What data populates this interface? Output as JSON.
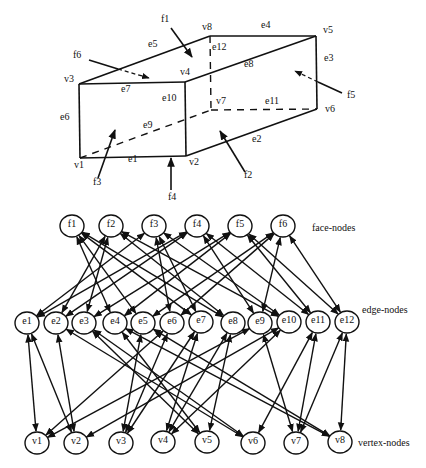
{
  "box": {
    "vertices": [
      {
        "id": "v1",
        "x": 80,
        "y": 158,
        "lx": 74,
        "ly": 168
      },
      {
        "id": "v2",
        "x": 186,
        "y": 156,
        "lx": 189,
        "ly": 165
      },
      {
        "id": "v3",
        "x": 79,
        "y": 84,
        "lx": 64,
        "ly": 82
      },
      {
        "id": "v4",
        "x": 185,
        "y": 82,
        "lx": 180,
        "ly": 75
      },
      {
        "id": "v5",
        "x": 316,
        "y": 36,
        "lx": 323,
        "ly": 33
      },
      {
        "id": "v6",
        "x": 317,
        "y": 109,
        "lx": 325,
        "ly": 112
      },
      {
        "id": "v7",
        "x": 211,
        "y": 110,
        "lx": 215,
        "ly": 104
      },
      {
        "id": "v8",
        "x": 210,
        "y": 36,
        "lx": 202,
        "ly": 30
      }
    ],
    "solid_lines": [
      [
        "v1",
        "v2"
      ],
      [
        "v2",
        "v6"
      ],
      [
        "v5",
        "v6"
      ],
      [
        "v8",
        "v5"
      ],
      [
        "v3",
        "v8"
      ],
      [
        "v1",
        "v3"
      ],
      [
        "v3",
        "v4"
      ],
      [
        "v4",
        "v5"
      ],
      [
        "v2",
        "v4"
      ]
    ],
    "dashed_lines": [
      [
        "v1",
        "v7"
      ],
      [
        "v7",
        "v6"
      ],
      [
        "v8",
        "v7"
      ]
    ],
    "edge_labels": [
      {
        "text": "e1",
        "x": 128,
        "y": 162
      },
      {
        "text": "e2",
        "x": 252,
        "y": 142
      },
      {
        "text": "e3",
        "x": 324,
        "y": 61
      },
      {
        "text": "e4",
        "x": 261,
        "y": 28
      },
      {
        "text": "e5",
        "x": 148,
        "y": 47
      },
      {
        "text": "e6",
        "x": 60,
        "y": 120
      },
      {
        "text": "e7",
        "x": 121,
        "y": 92
      },
      {
        "text": "e8",
        "x": 244,
        "y": 67
      },
      {
        "text": "e9",
        "x": 143,
        "y": 128
      },
      {
        "text": "e10",
        "x": 162,
        "y": 101
      },
      {
        "text": "e11",
        "x": 265,
        "y": 104
      },
      {
        "text": "e12",
        "x": 212,
        "y": 50
      },
      {
        "text": "v7",
        "x": 216,
        "y": 104
      }
    ],
    "face_arrows": [
      {
        "id": "f1",
        "lx": 161,
        "ly": 22,
        "x1": 171,
        "y1": 28,
        "x2": 192,
        "y2": 57,
        "dashed_from": null
      },
      {
        "id": "f2",
        "lx": 244,
        "ly": 178,
        "x1": 245,
        "y1": 172,
        "x2": 220,
        "y2": 131,
        "dashed_from": null
      },
      {
        "id": "f3",
        "lx": 93,
        "ly": 185,
        "x1": 98,
        "y1": 178,
        "x2": 115,
        "y2": 130,
        "dashed_from": null
      },
      {
        "id": "f4",
        "lx": 168,
        "ly": 200,
        "x1": 171,
        "y1": 190,
        "x2": 171,
        "y2": 158,
        "dashed_from": null
      },
      {
        "id": "f5",
        "lx": 347,
        "ly": 98,
        "x1": 342,
        "y1": 93,
        "x2": 295,
        "y2": 71,
        "dashed_from": [
          318,
          82
        ]
      },
      {
        "id": "f6",
        "lx": 73,
        "ly": 58,
        "x1": 89,
        "y1": 60,
        "x2": 149,
        "y2": 78,
        "dashed_from": [
          118,
          69
        ]
      }
    ]
  },
  "graph": {
    "row_labels": {
      "face": "face-nodes",
      "edge": "edge-nodes",
      "vertex": "vertex-nodes"
    },
    "face_nodes": [
      {
        "id": "f1",
        "x": 72,
        "y": 226
      },
      {
        "id": "f2",
        "x": 111,
        "y": 226
      },
      {
        "id": "f3",
        "x": 154,
        "y": 226
      },
      {
        "id": "f4",
        "x": 197,
        "y": 226
      },
      {
        "id": "f5",
        "x": 240,
        "y": 226
      },
      {
        "id": "f6",
        "x": 283,
        "y": 226
      }
    ],
    "edge_nodes": [
      {
        "id": "e1",
        "x": 27,
        "y": 323
      },
      {
        "id": "e2",
        "x": 56,
        "y": 323
      },
      {
        "id": "e3",
        "x": 84,
        "y": 323
      },
      {
        "id": "e4",
        "x": 115,
        "y": 323
      },
      {
        "id": "e5",
        "x": 143,
        "y": 323
      },
      {
        "id": "e6",
        "x": 172,
        "y": 323
      },
      {
        "id": "e7",
        "x": 201,
        "y": 322
      },
      {
        "id": "e8",
        "x": 233,
        "y": 323
      },
      {
        "id": "e9",
        "x": 260,
        "y": 323
      },
      {
        "id": "e10",
        "x": 289,
        "y": 322
      },
      {
        "id": "e11",
        "x": 318,
        "y": 322
      },
      {
        "id": "e12",
        "x": 347,
        "y": 322
      }
    ],
    "vertex_nodes": [
      {
        "id": "v1",
        "x": 37,
        "y": 443
      },
      {
        "id": "v2",
        "x": 76,
        "y": 443
      },
      {
        "id": "v3",
        "x": 121,
        "y": 443
      },
      {
        "id": "v4",
        "x": 163,
        "y": 442
      },
      {
        "id": "v5",
        "x": 207,
        "y": 442
      },
      {
        "id": "v6",
        "x": 253,
        "y": 443
      },
      {
        "id": "v7",
        "x": 296,
        "y": 443
      },
      {
        "id": "v8",
        "x": 340,
        "y": 442
      }
    ],
    "face_edge_links": [
      [
        "f1",
        "e4"
      ],
      [
        "f1",
        "e5"
      ],
      [
        "f1",
        "e7"
      ],
      [
        "f1",
        "e8"
      ],
      [
        "f2",
        "e2"
      ],
      [
        "f2",
        "e3"
      ],
      [
        "f2",
        "e8"
      ],
      [
        "f2",
        "e10"
      ],
      [
        "f3",
        "e1"
      ],
      [
        "f3",
        "e6"
      ],
      [
        "f3",
        "e7"
      ],
      [
        "f3",
        "e10"
      ],
      [
        "f4",
        "e1"
      ],
      [
        "f4",
        "e2"
      ],
      [
        "f4",
        "e9"
      ],
      [
        "f4",
        "e11"
      ],
      [
        "f5",
        "e3"
      ],
      [
        "f5",
        "e4"
      ],
      [
        "f5",
        "e11"
      ],
      [
        "f5",
        "e12"
      ],
      [
        "f6",
        "e5"
      ],
      [
        "f6",
        "e6"
      ],
      [
        "f6",
        "e9"
      ],
      [
        "f6",
        "e12"
      ]
    ],
    "edge_vertex_links": [
      [
        "e1",
        "v1"
      ],
      [
        "e1",
        "v2"
      ],
      [
        "e2",
        "v2"
      ],
      [
        "e2",
        "v6"
      ],
      [
        "e3",
        "v5"
      ],
      [
        "e3",
        "v6"
      ],
      [
        "e4",
        "v8"
      ],
      [
        "e4",
        "v5"
      ],
      [
        "e5",
        "v3"
      ],
      [
        "e5",
        "v8"
      ],
      [
        "e6",
        "v1"
      ],
      [
        "e6",
        "v3"
      ],
      [
        "e7",
        "v3"
      ],
      [
        "e7",
        "v4"
      ],
      [
        "e8",
        "v4"
      ],
      [
        "e8",
        "v5"
      ],
      [
        "e9",
        "v1"
      ],
      [
        "e9",
        "v7"
      ],
      [
        "e10",
        "v2"
      ],
      [
        "e10",
        "v4"
      ],
      [
        "e11",
        "v7"
      ],
      [
        "e11",
        "v6"
      ],
      [
        "e12",
        "v8"
      ],
      [
        "e12",
        "v7"
      ]
    ]
  }
}
